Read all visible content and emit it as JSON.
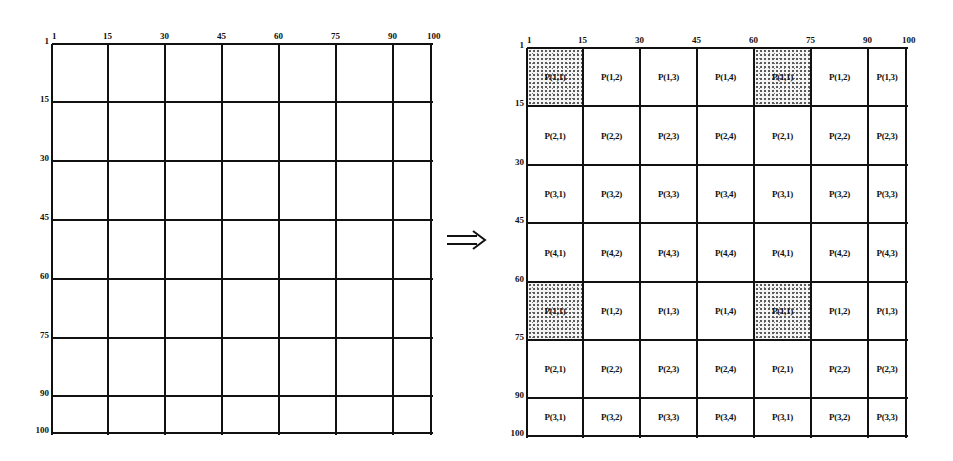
{
  "diagram": {
    "left_grid": {
      "x_ticks": [
        "1",
        "15",
        "30",
        "45",
        "60",
        "75",
        "90",
        "100"
      ],
      "y_ticks": [
        "1",
        "15",
        "30",
        "45",
        "60",
        "75",
        "90",
        "100"
      ]
    },
    "arrow": {
      "icon": "double-right-arrow-icon",
      "glyph": "⟹"
    },
    "right_grid": {
      "x_ticks": [
        "1",
        "15",
        "30",
        "45",
        "60",
        "75",
        "90",
        "100"
      ],
      "y_ticks": [
        "1",
        "15",
        "30",
        "45",
        "60",
        "75",
        "90",
        "100"
      ],
      "rows": [
        [
          "P(1,1)",
          "P(1,2)",
          "P(1,3)",
          "P(1,4)",
          "P(1,1)",
          "P(1,2)",
          "P(1,3)"
        ],
        [
          "P(2,1)",
          "P(2,2)",
          "P(2,3)",
          "P(2,4)",
          "P(2,1)",
          "P(2,2)",
          "P(2,3)"
        ],
        [
          "P(3,1)",
          "P(3,2)",
          "P(3,3)",
          "P(3,4)",
          "P(3,1)",
          "P(3,2)",
          "P(3,3)"
        ],
        [
          "P(4,1)",
          "P(4,2)",
          "P(4,3)",
          "P(4,4)",
          "P(4,1)",
          "P(4,2)",
          "P(4,3)"
        ],
        [
          "P(1,1)",
          "P(1,2)",
          "P(1,3)",
          "P(1,4)",
          "P(1,1)",
          "P(1,2)",
          "P(1,3)"
        ],
        [
          "P(2,1)",
          "P(2,2)",
          "P(2,3)",
          "P(2,4)",
          "P(2,1)",
          "P(2,2)",
          "P(2,3)"
        ],
        [
          "P(3,1)",
          "P(3,2)",
          "P(3,3)",
          "P(3,4)",
          "P(3,1)",
          "P(3,2)",
          "P(3,3)"
        ]
      ],
      "shaded_cells": [
        [
          0,
          0
        ],
        [
          0,
          4
        ],
        [
          4,
          0
        ],
        [
          4,
          4
        ]
      ]
    },
    "colors": {
      "line": "#111111",
      "background": "#ffffff",
      "shade_dots": "#555555"
    }
  }
}
